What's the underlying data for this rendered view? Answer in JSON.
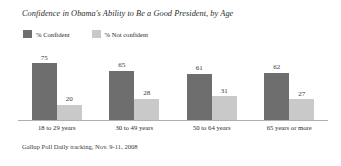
{
  "chart_data": {
    "type": "bar",
    "title": "Confidence in Obama's Ability to Be a Good President, by Age",
    "source": "Gallup Poll Daily tracking, Nov. 9-11, 2008",
    "xlabel": "",
    "ylabel": "",
    "ylim": [
      0,
      100
    ],
    "grid": false,
    "legend_position": "top-left",
    "categories": [
      "18 to 29 years",
      "30 to 49 years",
      "50 to 64 years",
      "65 years or more"
    ],
    "series": [
      {
        "name": "% Confident",
        "color": "#6e6e6e",
        "values": [
          75,
          65,
          61,
          62
        ]
      },
      {
        "name": "% Not confident",
        "color": "#c9c9c9",
        "values": [
          20,
          28,
          31,
          27
        ]
      }
    ]
  }
}
